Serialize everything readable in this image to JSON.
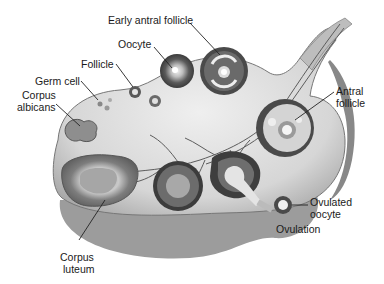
{
  "diagram": {
    "labels": {
      "early_antral_follicle": "Early antral follicle",
      "oocyte": "Oocyte",
      "follicle": "Follicle",
      "germ_cell": "Germ cell",
      "corpus_albicans_1": "Corpus",
      "corpus_albicans_2": "albicans",
      "antral_follicle_1": "Antral",
      "antral_follicle_2": "follicle",
      "ovulated_oocyte_1": "Ovulated",
      "ovulated_oocyte_2": "oocyte",
      "ovulation": "Ovulation",
      "corpus_luteum_1": "Corpus",
      "corpus_luteum_2": "luteum"
    },
    "colors": {
      "background": "#ffffff",
      "tissue": "#d9d9d9",
      "tissue_dark": "#8c8c8c",
      "stroma_edge": "#6e6e6e",
      "follicle_dark": "#4a4a4a",
      "text": "#1a1a1a"
    }
  }
}
